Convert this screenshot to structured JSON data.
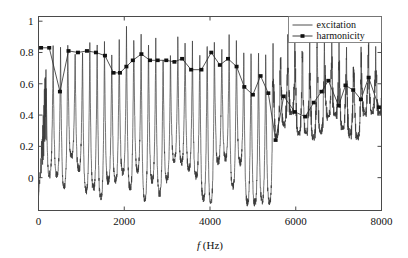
{
  "chart_data": {
    "type": "line",
    "title": "",
    "xlabel": "f (Hz)",
    "xlabel_italic_part": "f",
    "xlabel_rest": " (Hz)",
    "ylabel": "",
    "xlim": [
      0,
      8000
    ],
    "ylim": [
      -0.21,
      1.03
    ],
    "xticks": [
      0,
      2000,
      4000,
      6000,
      8000
    ],
    "xticklabels": [
      "0",
      "2000",
      "4000",
      "6000",
      "8000"
    ],
    "yticks": [
      0,
      0.2,
      0.4,
      0.6,
      0.8,
      1
    ],
    "yticklabels": [
      "0",
      "0.2",
      "0.4",
      "0.6",
      "0.8",
      "1"
    ],
    "grid": false,
    "legend_position": "top-right",
    "legend": [
      {
        "name": "excitation",
        "marker": "none",
        "line": "solid",
        "color": "#3a3a3a"
      },
      {
        "name": "harmonicity",
        "marker": "diamond",
        "line": "solid",
        "color": "#2a2a2a"
      }
    ],
    "series": [
      {
        "name": "excitation",
        "description": "harmonic comb spectrum, peaks spaced about 170 Hz",
        "x": [
          0,
          20,
          40,
          60,
          80,
          100,
          115,
          130,
          150,
          170,
          185,
          200,
          215,
          230,
          245,
          260,
          275,
          290,
          305,
          320,
          335,
          350,
          365,
          380,
          395,
          410,
          425,
          440,
          455,
          470,
          485,
          500,
          515,
          530,
          545,
          560,
          575,
          590,
          610,
          630,
          650,
          670,
          690,
          710,
          730,
          750,
          770,
          790,
          810,
          830,
          850,
          870,
          890,
          910,
          930,
          950,
          970,
          990,
          1010,
          1030,
          1050,
          1070,
          1090,
          1110,
          1130,
          1150,
          1170,
          1190,
          1210,
          1230,
          1250,
          1270,
          1290,
          1310,
          1330,
          1350,
          1370,
          1390,
          1410,
          1430,
          1450,
          1470,
          1490,
          1510,
          1530,
          1550,
          1570,
          1590,
          1610,
          1630,
          1650,
          1670,
          1690,
          1710,
          1730,
          1750,
          1770,
          1790,
          1810,
          1830,
          1850,
          1870,
          1890,
          1910,
          1930,
          1950,
          1970,
          1990,
          2010,
          2030,
          2050,
          2070,
          2090,
          2110,
          2130,
          2150,
          2170,
          2190,
          2210,
          2230,
          2250,
          2270,
          2290,
          2310,
          2330,
          2350,
          2370,
          2390,
          2410,
          2430,
          2450,
          2470,
          2490,
          2510,
          2530,
          2550,
          2570,
          2590,
          2610,
          2630,
          2650,
          2670,
          2690,
          2710,
          2730,
          2750,
          2770,
          2790,
          2810,
          2830,
          2850,
          2870,
          2890,
          2910,
          2930,
          2950,
          2970,
          2990,
          3010,
          3030,
          3050,
          3070,
          3090,
          3110,
          3130,
          3150,
          3170,
          3190,
          3210,
          3230,
          3250,
          3270,
          3290,
          3310,
          3330,
          3350,
          3370,
          3390,
          3410,
          3430,
          3450,
          3470,
          3490,
          3510,
          3530,
          3550,
          3570,
          3590,
          3610,
          3630,
          3650,
          3670,
          3690,
          3710,
          3730,
          3750,
          3770,
          3790,
          3810,
          3830,
          3850,
          3870,
          3890,
          3910,
          3930,
          3950,
          3970,
          3990,
          4010,
          4030,
          4050,
          4070,
          4090,
          4110,
          4130,
          4150,
          4170,
          4190,
          4210,
          4230,
          4250,
          4270,
          4290,
          4310,
          4330,
          4350,
          4370,
          4390,
          4410,
          4430,
          4450,
          4470,
          4490,
          4510,
          4530,
          4550,
          4570,
          4590,
          4610,
          4630,
          4650,
          4670,
          4690,
          4710,
          4730,
          4750,
          4770,
          4790,
          4810,
          4830,
          4850,
          4870,
          4890,
          4910,
          4930,
          4950,
          4970,
          4990,
          5010,
          5030,
          5050,
          5070,
          5090,
          5110,
          5130,
          5150,
          5170,
          5190,
          5210,
          5230,
          5250,
          5270,
          5290,
          5310,
          5330,
          5350,
          5370,
          5390,
          5410,
          5430,
          5450,
          5470,
          5490,
          5510,
          5530,
          5550,
          5570,
          5590,
          5610,
          5630,
          5650,
          5670,
          5690,
          5710,
          5730,
          5750,
          5770,
          5790,
          5810,
          5830,
          5850,
          5870,
          5890,
          5910,
          5930,
          5950,
          5970,
          5990,
          6010,
          6030,
          6050,
          6070,
          6090,
          6110,
          6130,
          6150,
          6170,
          6190,
          6210,
          6230,
          6250,
          6270,
          6290,
          6310,
          6330,
          6350,
          6370,
          6390,
          6410,
          6430,
          6450,
          6470,
          6490,
          6510,
          6530,
          6550,
          6570,
          6590,
          6610,
          6630,
          6650,
          6670,
          6690,
          6710,
          6730,
          6750,
          6770,
          6790,
          6810,
          6830,
          6850,
          6870,
          6890,
          6910,
          6930,
          6950,
          6970,
          6990,
          7010,
          7030,
          7050,
          7070,
          7090,
          7110,
          7130,
          7150,
          7170,
          7190,
          7210,
          7230,
          7250,
          7270,
          7290,
          7310,
          7330,
          7350,
          7370,
          7390,
          7410,
          7430,
          7450,
          7470,
          7490,
          7510,
          7530,
          7550,
          7570,
          7590,
          7610,
          7630,
          7650,
          7670,
          7690,
          7710,
          7730,
          7750,
          7770,
          7790,
          7810,
          7830,
          7850,
          7870,
          7890,
          7910,
          7930,
          7950,
          7970,
          7990
        ],
        "note": "values are rendered procedurally from the comb model in the template"
      },
      {
        "name": "harmonicity",
        "x": [
          60,
          250,
          500,
          700,
          920,
          1130,
          1340,
          1550,
          1750,
          1900,
          2050,
          2200,
          2400,
          2600,
          2780,
          2980,
          3170,
          3350,
          3560,
          3800,
          4030,
          4230,
          4420,
          4620,
          4800,
          5000,
          5180,
          5360,
          5530,
          5720,
          5980,
          6220,
          6420,
          6600,
          6760,
          7000,
          7160,
          7340,
          7520,
          7700,
          7940
        ],
        "values": [
          0.83,
          0.83,
          0.55,
          0.81,
          0.8,
          0.81,
          0.8,
          0.78,
          0.67,
          0.67,
          0.71,
          0.75,
          0.79,
          0.75,
          0.75,
          0.75,
          0.74,
          0.76,
          0.69,
          0.69,
          0.8,
          0.72,
          0.76,
          0.71,
          0.58,
          0.53,
          0.65,
          0.54,
          0.24,
          0.52,
          0.42,
          0.39,
          0.48,
          0.55,
          0.62,
          0.46,
          0.59,
          0.56,
          0.5,
          0.64,
          0.45
        ]
      }
    ]
  }
}
